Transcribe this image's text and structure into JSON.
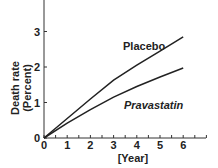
{
  "chart_data": {
    "type": "line",
    "title": "",
    "xlabel": "[Year]",
    "ylabel_line1": "Death rate",
    "ylabel_line2": "(Percent)",
    "xlim": [
      0,
      7
    ],
    "ylim": [
      0,
      3.9
    ],
    "x_ticks": [
      "0",
      "1",
      "2",
      "3",
      "4",
      "5",
      "6"
    ],
    "y_ticks": [
      "0",
      "1",
      "2",
      "3"
    ],
    "grid": false,
    "series": [
      {
        "name": "Placebo",
        "label_style": "bold",
        "x": [
          0,
          1,
          2,
          3,
          4,
          5,
          6
        ],
        "values": [
          0,
          0.55,
          1.1,
          1.63,
          2.05,
          2.45,
          2.85
        ]
      },
      {
        "name": "Pravastatin",
        "label_style": "bold-italic",
        "x": [
          0,
          1,
          2,
          3,
          4,
          5,
          6
        ],
        "values": [
          0,
          0.42,
          0.8,
          1.15,
          1.45,
          1.72,
          1.97
        ]
      }
    ]
  }
}
